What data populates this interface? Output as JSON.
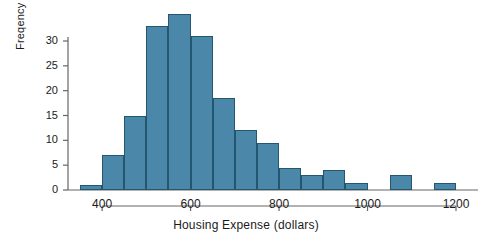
{
  "chart_data": {
    "type": "bar",
    "title": "",
    "subtitle": "",
    "xlabel": "Housing Expense (dollars)",
    "ylabel": "Freqency",
    "bin_width": 50,
    "bin_starts": [
      350,
      400,
      450,
      500,
      550,
      600,
      650,
      700,
      750,
      800,
      850,
      900,
      950,
      1000,
      1050,
      1100,
      1150
    ],
    "categories": [
      "350-400",
      "400-450",
      "450-500",
      "500-550",
      "550-600",
      "600-650",
      "650-700",
      "700-750",
      "750-800",
      "800-850",
      "850-900",
      "900-950",
      "950-1000",
      "1000-1050",
      "1050-1100",
      "1100-1150",
      "1150-1200"
    ],
    "values": [
      1,
      7,
      15,
      33,
      35.5,
      31,
      18.5,
      12,
      9.5,
      4.5,
      3,
      4,
      1.5,
      0,
      3,
      0,
      1.5
    ],
    "xlim": [
      350,
      1200
    ],
    "ylim": [
      0,
      36
    ],
    "xticks": [
      400,
      600,
      800,
      1000,
      1200
    ],
    "xtick_labels": [
      "400",
      "600",
      "800",
      "1000",
      "1200"
    ],
    "yticks": [
      0,
      5,
      10,
      15,
      20,
      25,
      30
    ],
    "ytick_labels": [
      "0",
      "5",
      "10",
      "15",
      "20",
      "25",
      "30"
    ],
    "grid": false,
    "legend": "none",
    "bar_color": "#4a87a8",
    "bar_edge_color": "#24566f",
    "axis_color": "#666666",
    "background": "#ffffff"
  }
}
